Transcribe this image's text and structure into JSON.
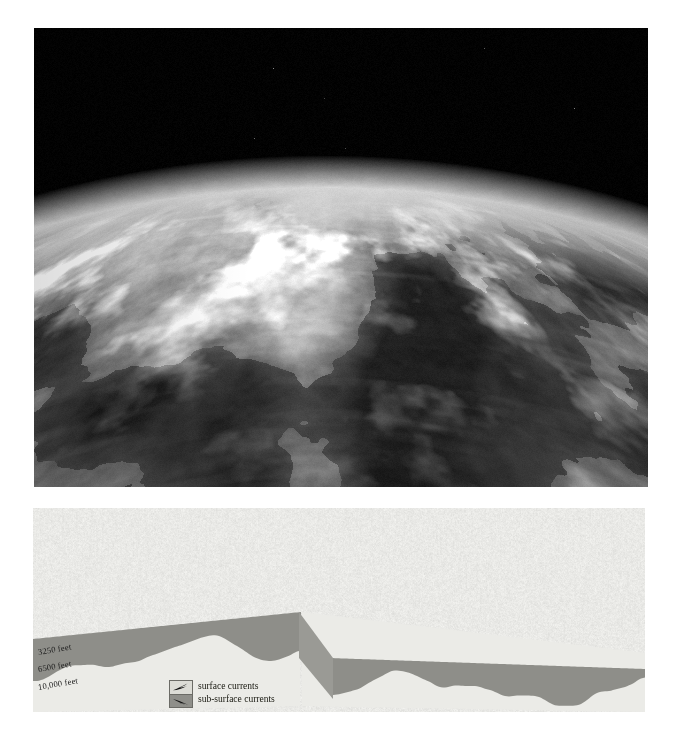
{
  "figure_photo": {
    "name": "satellite-photograph",
    "description": "Black-and-white oblique satellite photograph of the Earth's limb showing the Mediterranean Sea, the Italian peninsula and surrounding landmasses against the blackness of space",
    "orientation": "oblique-limb-view",
    "palette": {
      "space": "#000000",
      "atmosphere_glow": "#cfd4d6",
      "land_bright": "#d8d6cf",
      "land_mid": "#9a978e",
      "sea_dark": "#2a2d31",
      "sea_mid": "#45484c"
    }
  },
  "figure_diagram": {
    "name": "ocean-currents-block-diagram",
    "description": "Cut-away three-dimensional block diagram of the Mediterranean and Black Sea basins showing surface and sub-surface current circulation with depth strata",
    "depth_labels": [
      "3250 feet",
      "6500 feet",
      "10,000 feet"
    ],
    "legend": {
      "items": [
        {
          "icon": "surface-current-arrow-icon",
          "label": "surface currents",
          "swatch_color": "#dcdcd6"
        },
        {
          "icon": "subsurface-current-arrow-icon",
          "label": "sub-surface currents",
          "swatch_color": "#8f8f8a"
        }
      ]
    },
    "palette": {
      "background": "#e9e9e6",
      "land": "#dededa",
      "sea_surface": "#efefec",
      "water_body_cut": "#8e8e89",
      "water_body_cut_deep": "#7b7b76",
      "strata_face": "#e4e4e0",
      "outline": "#5a5a55",
      "arrow": "#141414"
    }
  }
}
